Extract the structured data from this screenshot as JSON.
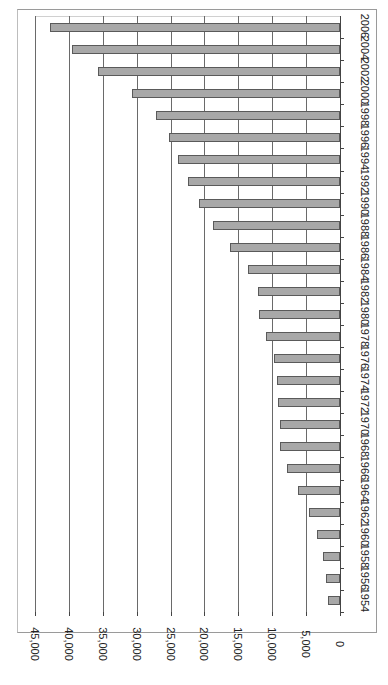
{
  "chart_data": {
    "type": "bar",
    "orientation": "horizontal-rotated-90",
    "title": "",
    "xlabel": "",
    "ylabel": "",
    "categories": [
      "1954",
      "1956",
      "1958",
      "1960",
      "1962",
      "1964",
      "1966",
      "1968",
      "1970",
      "1972",
      "1974",
      "1976",
      "1978",
      "1980",
      "1982",
      "1984",
      "1986",
      "1988",
      "1990",
      "1992",
      "1994",
      "1996",
      "1998",
      "2000",
      "2002",
      "2004",
      "2006"
    ],
    "values": [
      1800,
      2100,
      2500,
      3400,
      4600,
      6200,
      7800,
      8800,
      8800,
      9100,
      9300,
      9700,
      10900,
      11900,
      12100,
      13600,
      16200,
      18700,
      20800,
      22400,
      23900,
      25200,
      27100,
      30700,
      35700,
      39500,
      42800
    ],
    "value_ticks": [
      "0",
      "5,000",
      "10,000",
      "15,000",
      "20,000",
      "25,000",
      "30,000",
      "35,000",
      "40,000",
      "45,000"
    ],
    "ylim": [
      0,
      45000
    ],
    "grid": true,
    "legend": "none",
    "bar_color": "#a8a8a8",
    "bar_edge_color": "#5a5a5a"
  }
}
